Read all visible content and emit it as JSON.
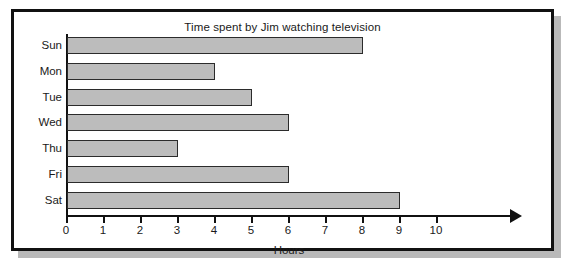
{
  "chart_data": {
    "type": "bar",
    "orientation": "horizontal",
    "title": "Time spent by Jim watching television",
    "xlabel": "Hours",
    "ylabel": "",
    "categories": [
      "Sun",
      "Mon",
      "Tue",
      "Wed",
      "Thu",
      "Fri",
      "Sat"
    ],
    "values": [
      8,
      4,
      5,
      6,
      3,
      6,
      9
    ],
    "xticks": [
      0,
      1,
      2,
      3,
      4,
      5,
      6,
      7,
      8,
      9,
      10
    ],
    "xtick_labels": [
      "0",
      "1",
      "2",
      "3",
      "4",
      "5",
      "6",
      "7",
      "8",
      "9",
      "10"
    ],
    "xlim": [
      0,
      10
    ],
    "grid": false,
    "legend": null,
    "bar_fill_color": "#bcbcbc",
    "bar_edge_color": "#2b2b2b",
    "axis_color": "#111111",
    "frame_color": "#111111",
    "background_color": "#ffffff"
  }
}
